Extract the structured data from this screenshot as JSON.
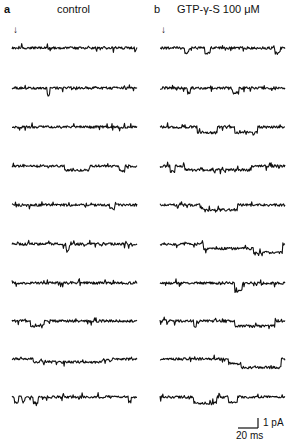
{
  "figure": {
    "panels": [
      {
        "letter": "a",
        "title": "control",
        "marker": "↓",
        "trace_count": 10,
        "traces": [
          {
            "seed": 11,
            "events": []
          },
          {
            "seed": 23,
            "events": [
              {
                "start": 0.28,
                "end": 0.3,
                "depth": 1.4
              }
            ]
          },
          {
            "seed": 37,
            "events": []
          },
          {
            "seed": 41,
            "events": [
              {
                "start": 0.42,
                "end": 0.62,
                "depth": 0.8
              },
              {
                "start": 0.86,
                "end": 0.9,
                "depth": 1.0
              }
            ]
          },
          {
            "seed": 53,
            "events": [
              {
                "start": 0.78,
                "end": 0.82,
                "depth": 0.8
              }
            ]
          },
          {
            "seed": 67,
            "events": [
              {
                "start": 0.43,
                "end": 0.46,
                "depth": 1.3
              }
            ]
          },
          {
            "seed": 71,
            "events": []
          },
          {
            "seed": 83,
            "events": [
              {
                "start": 0.15,
                "end": 0.25,
                "depth": 1.0
              }
            ]
          },
          {
            "seed": 97,
            "events": [
              {
                "start": 0.17,
                "end": 0.72,
                "depth": 0.6
              },
              {
                "start": 0.78,
                "end": 0.8,
                "depth": 0.4
              }
            ]
          },
          {
            "seed": 101,
            "events": [
              {
                "start": 0.02,
                "end": 0.05,
                "depth": 1.1
              },
              {
                "start": 0.08,
                "end": 0.1,
                "depth": 1.0
              },
              {
                "start": 0.17,
                "end": 0.21,
                "depth": 1.2
              },
              {
                "start": 0.93,
                "end": 0.95,
                "depth": 1.0
              }
            ]
          }
        ]
      },
      {
        "letter": "b",
        "title": "GTP-γ-S  100 μM",
        "marker": "↓",
        "trace_count": 10,
        "traces": [
          {
            "seed": 13,
            "events": [
              {
                "start": 0.2,
                "end": 0.23,
                "depth": 1.0
              },
              {
                "start": 0.36,
                "end": 0.4,
                "depth": 1.1
              },
              {
                "start": 0.92,
                "end": 0.96,
                "depth": 1.0
              }
            ]
          },
          {
            "seed": 29,
            "events": [
              {
                "start": 0.22,
                "end": 0.24,
                "depth": 1.0
              },
              {
                "start": 0.58,
                "end": 0.63,
                "depth": 1.0
              }
            ]
          },
          {
            "seed": 31,
            "events": [
              {
                "start": 0.3,
                "end": 0.46,
                "depth": 1.1
              },
              {
                "start": 0.6,
                "end": 0.78,
                "depth": 1.1
              }
            ]
          },
          {
            "seed": 43,
            "events": [
              {
                "start": 0.08,
                "end": 0.12,
                "depth": 1.1
              },
              {
                "start": 0.2,
                "end": 0.73,
                "depth": 0.8
              }
            ]
          },
          {
            "seed": 59,
            "events": [
              {
                "start": 0.33,
                "end": 0.62,
                "depth": 1.0
              }
            ]
          },
          {
            "seed": 61,
            "events": [
              {
                "start": 0.35,
                "end": 0.75,
                "depth": 0.9
              },
              {
                "start": 0.75,
                "end": 0.98,
                "depth": 1.7
              }
            ]
          },
          {
            "seed": 73,
            "events": [
              {
                "start": 0.6,
                "end": 0.66,
                "depth": 1.7
              }
            ]
          },
          {
            "seed": 89,
            "events": [
              {
                "start": 0.27,
                "end": 0.29,
                "depth": 1.2
              },
              {
                "start": 0.6,
                "end": 0.92,
                "depth": 1.0
              }
            ]
          },
          {
            "seed": 103,
            "events": [
              {
                "start": 0.55,
                "end": 0.65,
                "depth": 0.9
              },
              {
                "start": 0.65,
                "end": 0.97,
                "depth": 1.7
              }
            ]
          },
          {
            "seed": 107,
            "events": [
              {
                "start": 0.27,
                "end": 0.45,
                "depth": 1.2
              },
              {
                "start": 0.55,
                "end": 0.62,
                "depth": 1.0
              }
            ]
          }
        ]
      }
    ],
    "scale_bar": {
      "current_label": "1 pA",
      "time_label": "20 ms"
    },
    "colors": {
      "ink": "#111111",
      "background": "#ffffff"
    }
  }
}
